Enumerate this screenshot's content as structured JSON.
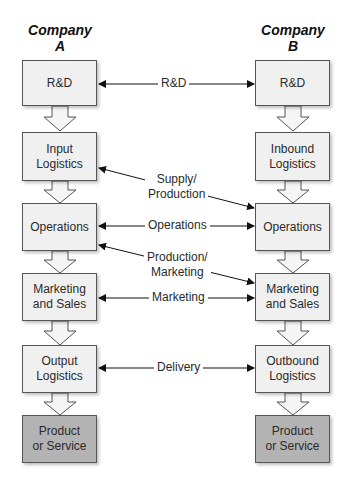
{
  "company_a": {
    "title_line1": "Company",
    "title_line2": "A",
    "boxes": [
      {
        "line1": "R&D",
        "line2": ""
      },
      {
        "line1": "Input",
        "line2": "Logistics"
      },
      {
        "line1": "Operations",
        "line2": ""
      },
      {
        "line1": "Marketing",
        "line2": "and Sales"
      },
      {
        "line1": "Output",
        "line2": "Logistics"
      },
      {
        "line1": "Product",
        "line2": "or Service"
      }
    ]
  },
  "company_b": {
    "title_line1": "Company",
    "title_line2": "B",
    "boxes": [
      {
        "line1": "R&D",
        "line2": ""
      },
      {
        "line1": "Inbound",
        "line2": "Logistics"
      },
      {
        "line1": "Operations",
        "line2": ""
      },
      {
        "line1": "Marketing",
        "line2": "and Sales"
      },
      {
        "line1": "Outbound",
        "line2": "Logistics"
      },
      {
        "line1": "Product",
        "line2": "or Service"
      }
    ]
  },
  "links": [
    {
      "line1": "R&D",
      "line2": ""
    },
    {
      "line1": "Supply/",
      "line2": "Production"
    },
    {
      "line1": "Operations",
      "line2": ""
    },
    {
      "line1": "Production/",
      "line2": "Marketing"
    },
    {
      "line1": "Marketing",
      "line2": ""
    },
    {
      "line1": "Delivery",
      "line2": ""
    }
  ],
  "colors": {
    "box_fill": "#f0f0f0",
    "final_box_fill": "#b3b3b3",
    "border": "#555555",
    "arrow": "#111111"
  }
}
